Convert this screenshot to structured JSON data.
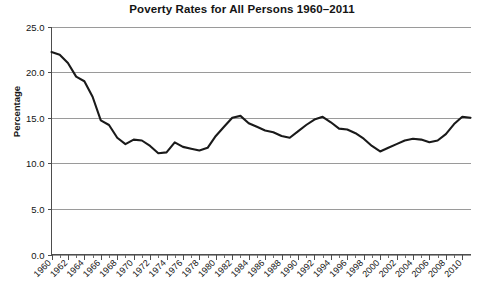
{
  "chart_data": {
    "type": "line",
    "title": "Poverty Rates for All Persons 1960–2011",
    "xlabel": "",
    "ylabel": "Percentage",
    "ylim": [
      0.0,
      25.0
    ],
    "xlim": [
      1960,
      2011
    ],
    "grid": true,
    "legend": "none",
    "y_ticks": [
      "0.0",
      "5.0",
      "10.0",
      "15.0",
      "20.0",
      "25.0"
    ],
    "y_tick_values": [
      0.0,
      5.0,
      10.0,
      15.0,
      20.0,
      25.0
    ],
    "x_ticks": [
      "1960",
      "1962",
      "1964",
      "1966",
      "1968",
      "1970",
      "1972",
      "1974",
      "1976",
      "1978",
      "1980",
      "1982",
      "1984",
      "1986",
      "1988",
      "1990",
      "1992",
      "1994",
      "1996",
      "1998",
      "2000",
      "2002",
      "2004",
      "2006",
      "2008",
      "2010"
    ],
    "x_tick_values": [
      1960,
      1962,
      1964,
      1966,
      1968,
      1970,
      1972,
      1974,
      1976,
      1978,
      1980,
      1982,
      1984,
      1986,
      1988,
      1990,
      1992,
      1994,
      1996,
      1998,
      2000,
      2002,
      2004,
      2006,
      2008,
      2010
    ],
    "series": [
      {
        "name": "Poverty Rate",
        "color": "#1a1a1a",
        "x": [
          1960,
          1961,
          1962,
          1963,
          1964,
          1965,
          1966,
          1967,
          1968,
          1969,
          1970,
          1971,
          1972,
          1973,
          1974,
          1975,
          1976,
          1977,
          1978,
          1979,
          1980,
          1981,
          1982,
          1983,
          1984,
          1985,
          1986,
          1987,
          1988,
          1989,
          1990,
          1991,
          1992,
          1993,
          1994,
          1995,
          1996,
          1997,
          1998,
          1999,
          2000,
          2001,
          2002,
          2003,
          2004,
          2005,
          2006,
          2007,
          2008,
          2009,
          2010,
          2011
        ],
        "values": [
          22.2,
          21.9,
          21.0,
          19.5,
          19.0,
          17.3,
          14.7,
          14.2,
          12.8,
          12.1,
          12.6,
          12.5,
          11.9,
          11.1,
          11.2,
          12.3,
          11.8,
          11.6,
          11.4,
          11.7,
          13.0,
          14.0,
          15.0,
          15.2,
          14.4,
          14.0,
          13.6,
          13.4,
          13.0,
          12.8,
          13.5,
          14.2,
          14.8,
          15.1,
          14.5,
          13.8,
          13.7,
          13.3,
          12.7,
          11.9,
          11.3,
          11.7,
          12.1,
          12.5,
          12.7,
          12.6,
          12.3,
          12.5,
          13.2,
          14.3,
          15.1,
          15.0
        ]
      }
    ]
  }
}
